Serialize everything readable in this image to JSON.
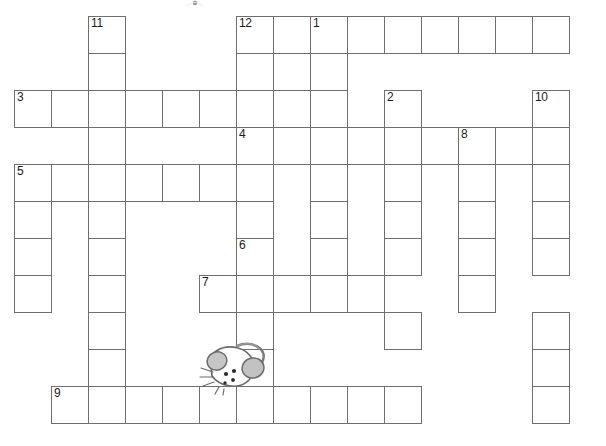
{
  "puzzle": {
    "title": "Crossword puzzle grid",
    "type": "crossword",
    "cell_size": 37,
    "origin_x": 14,
    "origin_y": 16,
    "grid_columns": 16,
    "grid_rows": 12,
    "background_color": "#ffffff",
    "cell_border_color": "#6e6e6e",
    "number_color": "#1a1a1a",
    "clue_numbers_visible": [
      "1",
      "2",
      "3",
      "4",
      "5",
      "6",
      "7",
      "8",
      "9",
      "10",
      "11",
      "12"
    ],
    "entries": [
      {
        "number": "1",
        "direction": "down",
        "col": 8,
        "row": 0,
        "length": 3
      },
      {
        "number": "2",
        "direction": "down",
        "col": 10,
        "row": 2,
        "length": 5
      },
      {
        "number": "3",
        "direction": "across",
        "col": 0,
        "row": 2,
        "length": 6
      },
      {
        "number": "4",
        "direction": "across",
        "col": 6,
        "row": 3,
        "length": 9
      },
      {
        "number": "5",
        "direction": "across",
        "col": 0,
        "row": 4,
        "length": 6
      },
      {
        "number": "6",
        "direction": "down",
        "col": 6,
        "row": 6,
        "length": 5
      },
      {
        "number": "7",
        "direction": "across",
        "col": 5,
        "row": 7,
        "length": 5
      },
      {
        "number": "8",
        "direction": "down",
        "col": 12,
        "row": 3,
        "length": 6
      },
      {
        "number": "9",
        "direction": "across",
        "col": 1,
        "row": 10,
        "length": 10
      },
      {
        "number": "10",
        "direction": "down",
        "col": 14,
        "row": 2,
        "length": 9
      },
      {
        "number": "11",
        "direction": "down",
        "col": 2,
        "row": 0,
        "length": 11
      },
      {
        "number": "12",
        "direction": "down",
        "col": 6,
        "row": 0,
        "length": 4
      }
    ],
    "cells": [
      {
        "col": 2,
        "row": 0,
        "number": "11",
        "value": ""
      },
      {
        "col": 6,
        "row": 0,
        "number": "12",
        "value": ""
      },
      {
        "col": 7,
        "row": 0,
        "number": "",
        "value": ""
      },
      {
        "col": 8,
        "row": 0,
        "number": "1",
        "value": ""
      },
      {
        "col": 9,
        "row": 0,
        "number": "",
        "value": ""
      },
      {
        "col": 10,
        "row": 0,
        "number": "",
        "value": ""
      },
      {
        "col": 11,
        "row": 0,
        "number": "",
        "value": ""
      },
      {
        "col": 12,
        "row": 0,
        "number": "",
        "value": ""
      },
      {
        "col": 13,
        "row": 0,
        "number": "",
        "value": ""
      },
      {
        "col": 14,
        "row": 0,
        "number": "",
        "value": ""
      },
      {
        "col": 2,
        "row": 1,
        "number": "",
        "value": ""
      },
      {
        "col": 6,
        "row": 1,
        "number": "",
        "value": ""
      },
      {
        "col": 7,
        "row": 1,
        "number": "",
        "value": ""
      },
      {
        "col": 8,
        "row": 1,
        "number": "",
        "value": ""
      },
      {
        "col": 0,
        "row": 2,
        "number": "3",
        "value": ""
      },
      {
        "col": 1,
        "row": 2,
        "number": "",
        "value": ""
      },
      {
        "col": 2,
        "row": 2,
        "number": "",
        "value": ""
      },
      {
        "col": 3,
        "row": 2,
        "number": "",
        "value": ""
      },
      {
        "col": 4,
        "row": 2,
        "number": "",
        "value": ""
      },
      {
        "col": 5,
        "row": 2,
        "number": "",
        "value": ""
      },
      {
        "col": 6,
        "row": 2,
        "number": "",
        "value": ""
      },
      {
        "col": 8,
        "row": 2,
        "number": "",
        "value": ""
      },
      {
        "col": 10,
        "row": 2,
        "number": "2",
        "value": ""
      },
      {
        "col": 14,
        "row": 2,
        "number": "10",
        "value": ""
      },
      {
        "col": 2,
        "row": 3,
        "number": "",
        "value": ""
      },
      {
        "col": 6,
        "row": 3,
        "number": "4",
        "value": ""
      },
      {
        "col": 7,
        "row": 3,
        "number": "",
        "value": ""
      },
      {
        "col": 8,
        "row": 3,
        "number": "",
        "value": ""
      },
      {
        "col": 9,
        "row": 3,
        "number": "",
        "value": ""
      },
      {
        "col": 10,
        "row": 3,
        "number": "",
        "value": ""
      },
      {
        "col": 11,
        "row": 3,
        "number": "",
        "value": ""
      },
      {
        "col": 12,
        "row": 3,
        "number": "8",
        "value": ""
      },
      {
        "col": 13,
        "row": 3,
        "number": "",
        "value": ""
      },
      {
        "col": 14,
        "row": 3,
        "number": "",
        "value": ""
      },
      {
        "col": 0,
        "row": 4,
        "number": "5",
        "value": ""
      },
      {
        "col": 1,
        "row": 4,
        "number": "",
        "value": ""
      },
      {
        "col": 2,
        "row": 4,
        "number": "",
        "value": ""
      },
      {
        "col": 3,
        "row": 4,
        "number": "",
        "value": ""
      },
      {
        "col": 4,
        "row": 4,
        "number": "",
        "value": ""
      },
      {
        "col": 5,
        "row": 4,
        "number": "",
        "value": ""
      },
      {
        "col": 6,
        "row": 4,
        "number": "",
        "value": ""
      },
      {
        "col": 8,
        "row": 4,
        "number": "",
        "value": ""
      },
      {
        "col": 10,
        "row": 4,
        "number": "",
        "value": ""
      },
      {
        "col": 12,
        "row": 4,
        "number": "",
        "value": ""
      },
      {
        "col": 14,
        "row": 4,
        "number": "",
        "value": ""
      },
      {
        "col": 0,
        "row": 5,
        "number": "",
        "value": ""
      },
      {
        "col": 2,
        "row": 5,
        "number": "",
        "value": ""
      },
      {
        "col": 6,
        "row": 5,
        "number": "",
        "value": ""
      },
      {
        "col": 8,
        "row": 5,
        "number": "",
        "value": ""
      },
      {
        "col": 10,
        "row": 5,
        "number": "",
        "value": ""
      },
      {
        "col": 12,
        "row": 5,
        "number": "",
        "value": ""
      },
      {
        "col": 14,
        "row": 5,
        "number": "",
        "value": ""
      },
      {
        "col": 0,
        "row": 6,
        "number": "",
        "value": ""
      },
      {
        "col": 2,
        "row": 6,
        "number": "",
        "value": ""
      },
      {
        "col": 6,
        "row": 6,
        "number": "6",
        "value": ""
      },
      {
        "col": 8,
        "row": 6,
        "number": "",
        "value": ""
      },
      {
        "col": 10,
        "row": 6,
        "number": "",
        "value": ""
      },
      {
        "col": 12,
        "row": 6,
        "number": "",
        "value": ""
      },
      {
        "col": 14,
        "row": 6,
        "number": "",
        "value": ""
      },
      {
        "col": 0,
        "row": 7,
        "number": "",
        "value": ""
      },
      {
        "col": 2,
        "row": 7,
        "number": "",
        "value": ""
      },
      {
        "col": 5,
        "row": 7,
        "number": "7",
        "value": ""
      },
      {
        "col": 6,
        "row": 7,
        "number": "",
        "value": ""
      },
      {
        "col": 7,
        "row": 7,
        "number": "",
        "value": ""
      },
      {
        "col": 8,
        "row": 7,
        "number": "",
        "value": ""
      },
      {
        "col": 9,
        "row": 7,
        "number": "",
        "value": ""
      },
      {
        "col": 12,
        "row": 7,
        "number": "",
        "value": ""
      },
      {
        "col": 2,
        "row": 8,
        "number": "",
        "value": ""
      },
      {
        "col": 6,
        "row": 8,
        "number": "",
        "value": ""
      },
      {
        "col": 10,
        "row": 8,
        "number": "",
        "value": ""
      },
      {
        "col": 14,
        "row": 8,
        "number": "",
        "value": ""
      },
      {
        "col": 2,
        "row": 9,
        "number": "",
        "value": ""
      },
      {
        "col": 6,
        "row": 9,
        "number": "",
        "value": ""
      },
      {
        "col": 14,
        "row": 9,
        "number": "",
        "value": ""
      },
      {
        "col": 1,
        "row": 10,
        "number": "9",
        "value": ""
      },
      {
        "col": 2,
        "row": 10,
        "number": "",
        "value": ""
      },
      {
        "col": 3,
        "row": 10,
        "number": "",
        "value": ""
      },
      {
        "col": 4,
        "row": 10,
        "number": "",
        "value": ""
      },
      {
        "col": 5,
        "row": 10,
        "number": "",
        "value": ""
      },
      {
        "col": 6,
        "row": 10,
        "number": "",
        "value": ""
      },
      {
        "col": 7,
        "row": 10,
        "number": "",
        "value": ""
      },
      {
        "col": 8,
        "row": 10,
        "number": "",
        "value": ""
      },
      {
        "col": 9,
        "row": 10,
        "number": "",
        "value": ""
      },
      {
        "col": 10,
        "row": 10,
        "number": "",
        "value": ""
      },
      {
        "col": 14,
        "row": 10,
        "number": "",
        "value": ""
      }
    ],
    "decoration": {
      "mouse_illustration": {
        "name": "mouse-illustration",
        "body_color": "#b9b9b9",
        "ear_color": "#bdbdbd",
        "outline_color": "#6b6b6b"
      }
    }
  }
}
